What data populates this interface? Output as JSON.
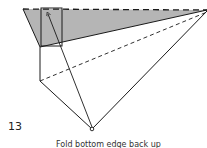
{
  "figure": {
    "step_number": "13",
    "caption": "Fold bottom edge back up",
    "colors": {
      "shade": "#b5b5b5",
      "line": "#1a1a1a"
    },
    "elements": {
      "top_edge": "dashed valley fold line",
      "shaded_flap": "gray shaded triangular flap",
      "flap_box": "rectangular pocket outline",
      "diagonal_dashed": "dashed fold line",
      "arrow": "fold direction arrow",
      "pivot": "bottom vertex marker"
    }
  }
}
